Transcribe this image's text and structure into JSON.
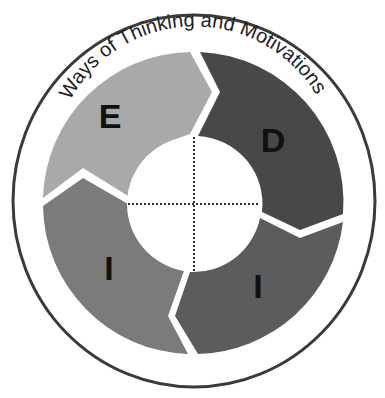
{
  "diagram": {
    "title": "Ways of Thinking and Motivations",
    "segments": [
      {
        "letter": "E",
        "position": "top-left",
        "color": "#a9a9a9"
      },
      {
        "letter": "D",
        "position": "top-right",
        "color": "#484848"
      },
      {
        "letter": "I",
        "position": "bottom-right",
        "color": "#5c5c5c"
      },
      {
        "letter": "I",
        "position": "bottom-left",
        "color": "#7b7b7b"
      }
    ],
    "colors": {
      "outer_ring": "#3a3a3a",
      "background": "#ffffff",
      "center": "#ffffff",
      "divider": "#333333"
    }
  }
}
